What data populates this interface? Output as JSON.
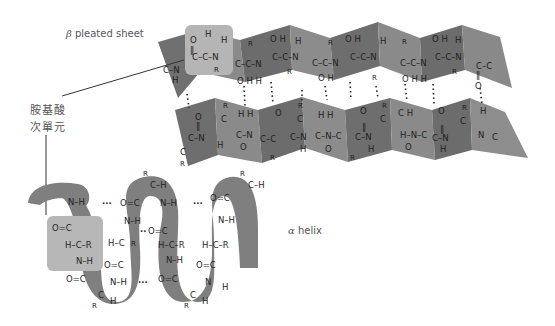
{
  "labels": {
    "beta_symbol": "β",
    "beta_text": " pleated sheet",
    "alpha_symbol": "α",
    "alpha_text": " helix",
    "amino_line1": "胺基酸",
    "amino_line2": "次單元"
  },
  "colors": {
    "sheet_dark": "#6e6e6e",
    "sheet_mid": "#838383",
    "sheet_light": "#9a9a9a",
    "helix_ribbon": "#7d7d7d",
    "highlight_box": "#b3b3b3",
    "text": "#1f1f1f",
    "label_text": "#555555"
  },
  "atoms": {
    "O": "O",
    "C": "C",
    "N": "N",
    "H": "H",
    "R": "R"
  }
}
